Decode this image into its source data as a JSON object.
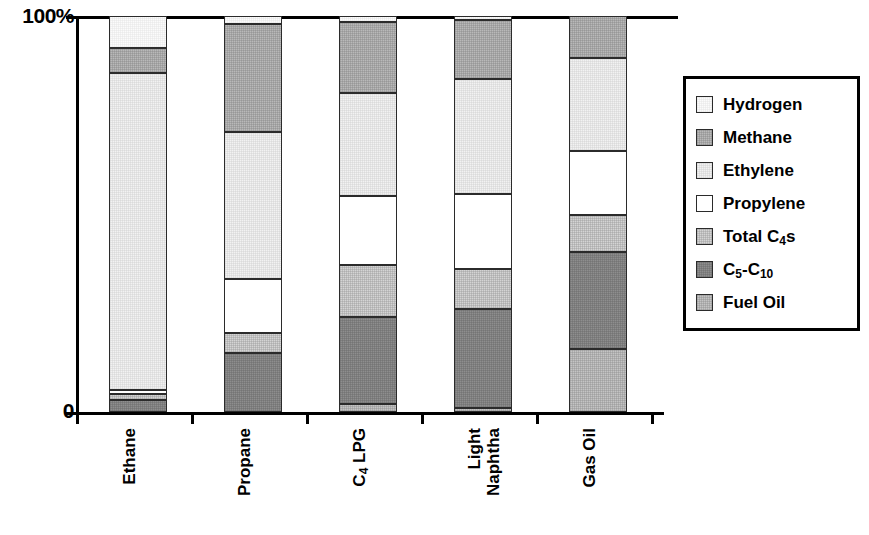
{
  "chart_data": {
    "type": "bar",
    "variant": "stacked-100-percent",
    "title": "",
    "xlabel": "",
    "ylabel": "",
    "ylim": [
      0,
      100
    ],
    "yticks": [
      "0",
      "100%"
    ],
    "grid": false,
    "legend_position": "right",
    "categories": [
      "Ethane",
      "Propane",
      "C4 LPG",
      "Light Naphtha",
      "Gas Oil"
    ],
    "category_labels": [
      {
        "line1": "Ethane",
        "line2": ""
      },
      {
        "line1": "Propane",
        "line2": ""
      },
      {
        "line1": "C",
        "sub": "4",
        "line1b": " LPG",
        "line2": ""
      },
      {
        "line1": "Light",
        "line2": "Naphtha"
      },
      {
        "line1": "Gas Oil",
        "line2": ""
      }
    ],
    "series": [
      {
        "name": "Hydrogen",
        "color": "#fbfbfb",
        "values": [
          8.0,
          2.0,
          1.5,
          1.0,
          0.0
        ]
      },
      {
        "name": "Methane",
        "color": "#b9b9b9",
        "values": [
          6.5,
          27.3,
          18.0,
          15.0,
          10.5
        ]
      },
      {
        "name": "Ethylene",
        "color": "#f2f2f2",
        "values": [
          80.0,
          37.1,
          26.0,
          29.0,
          23.7
        ]
      },
      {
        "name": "Propylene",
        "color": "#ffffff",
        "values": [
          1.0,
          13.6,
          17.5,
          19.0,
          16.0
        ]
      },
      {
        "name": "Total C4s",
        "color": "#d4d4d4",
        "values": [
          1.5,
          5.1,
          13.0,
          10.0,
          9.5
        ]
      },
      {
        "name": "C5-C10",
        "color": "#8e8e8e",
        "values": [
          3.0,
          14.9,
          22.0,
          25.0,
          24.3
        ]
      },
      {
        "name": "Fuel Oil",
        "color": "#c4c4c4",
        "values": [
          0.0,
          0.0,
          2.0,
          1.0,
          16.0
        ]
      }
    ]
  },
  "axis": {
    "y_top_label": "100%",
    "y_zero_label": "0"
  },
  "legend": {
    "items": [
      {
        "label": "Hydrogen",
        "sub": "",
        "tail": "",
        "swatch": "#fbfbfb",
        "fill_class": "fill-hydrogen"
      },
      {
        "label": "Methane",
        "sub": "",
        "tail": "",
        "swatch": "#b9b9b9",
        "fill_class": "fill-methane"
      },
      {
        "label": "Ethylene",
        "sub": "",
        "tail": "",
        "swatch": "#f2f2f2",
        "fill_class": "fill-ethylene"
      },
      {
        "label": "Propylene",
        "sub": "",
        "tail": "",
        "swatch": "#ffffff",
        "fill_class": "fill-propylene"
      },
      {
        "label": "Total C",
        "sub": "4",
        "tail": "s",
        "swatch": "#d4d4d4",
        "fill_class": "fill-c4s"
      },
      {
        "label": "C",
        "sub": "5",
        "tail": "-C",
        "sub2": "10",
        "swatch": "#8e8e8e",
        "fill_class": "fill-c5c10"
      },
      {
        "label": "Fuel Oil",
        "sub": "",
        "tail": "",
        "swatch": "#c4c4c4",
        "fill_class": "fill-fueloil"
      }
    ]
  },
  "xlabels": {
    "ethane": "Ethane",
    "propane": "Propane",
    "c4lpg_main": "C",
    "c4lpg_sub": "4",
    "c4lpg_tail": " LPG",
    "light": "Light",
    "naphtha": "Naphtha",
    "gasoil": "Gas Oil"
  }
}
